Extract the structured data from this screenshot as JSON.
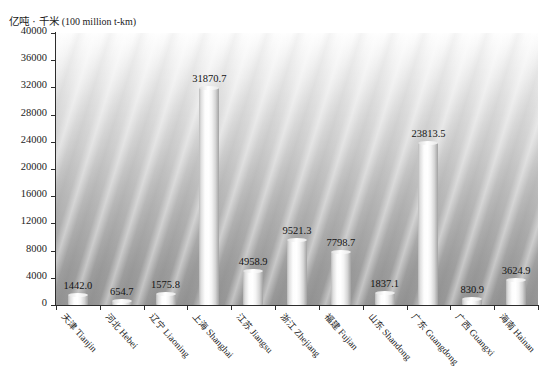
{
  "chart_data": {
    "type": "bar",
    "title": "",
    "ylabel": "亿吨·千米（100 million t-km）",
    "ylabel_cn": "亿吨 · 千米",
    "ylabel_en": "(100 million t-km)",
    "xlabel": "",
    "ylim": [
      0,
      40000
    ],
    "yticks": [
      40000,
      36000,
      32000,
      28000,
      24000,
      20000,
      16000,
      12000,
      8000,
      4000,
      0
    ],
    "ytick_labels": [
      "40000",
      "36000",
      "32000",
      "28000",
      "24000",
      "20000",
      "16000",
      "12000",
      "8000",
      "4000",
      "0"
    ],
    "grid": false,
    "legend": "none",
    "categories": [
      "天津 Tianjin",
      "河北 Hebei",
      "辽宁 Liaoning",
      "上海 Shanghai",
      "江苏 Jiangsu",
      "浙江 Zhejiang",
      "福建 Fujian",
      "山东 Shandong",
      "广东 Guangdong",
      "广西 Guangxi",
      "海南 Hainan"
    ],
    "categories_cn": [
      "天津",
      "河北",
      "辽宁",
      "上海",
      "江苏",
      "浙江",
      "福建",
      "山东",
      "广东",
      "广西",
      "海南"
    ],
    "categories_en": [
      "Tianjin",
      "Hebei",
      "Liaoning",
      "Shanghai",
      "Jiangsu",
      "Zhejiang",
      "Fujian",
      "Shandong",
      "Guangdong",
      "Guangxi",
      "Hainan"
    ],
    "values": [
      1442.0,
      654.7,
      1575.8,
      31870.7,
      4958.9,
      9521.3,
      7798.7,
      1837.1,
      23813.5,
      830.9,
      3624.9
    ],
    "value_labels": [
      "1442.0",
      "654.7",
      "1575.8",
      "31870.7",
      "4958.9",
      "9521.3",
      "7798.7",
      "1837.1",
      "23813.5",
      "830.9",
      "3624.9"
    ]
  },
  "colors": {
    "bar_light": "#ffffff",
    "bar_shadow": "#a2a2a2",
    "axis": "#2c2c2c",
    "text": "#1b1b1b",
    "plot_bg_top": "#fdfdfd",
    "plot_bg_bottom": "#969696"
  }
}
